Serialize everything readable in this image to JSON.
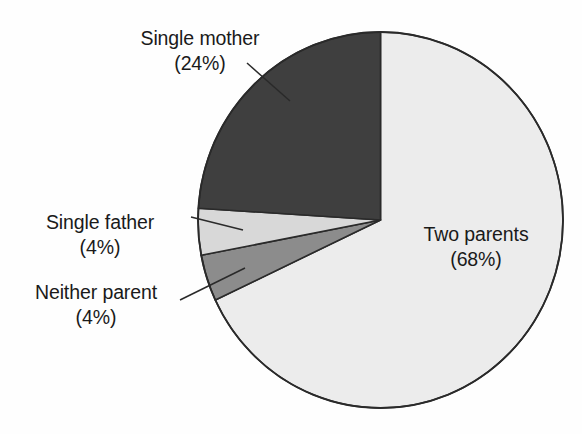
{
  "figure": {
    "background_color": "#fefefe",
    "width": 582,
    "height": 434
  },
  "chart_data": {
    "type": "pie",
    "title": "",
    "subtitle": "",
    "xlabel": "",
    "ylabel": "",
    "legend_position": "none",
    "grid": false,
    "units": "percent",
    "total": 100,
    "start_angle_deg": 0,
    "direction": "clockwise",
    "categories": [
      "Two parents",
      "Single mother",
      "Single father",
      "Neither parent"
    ],
    "values": [
      68,
      24,
      4,
      4
    ],
    "labels": [
      "Two parents (68%)",
      "Single mother (24%)",
      "Single father (4%)",
      "Neither parent (4%)"
    ],
    "colors": [
      "#ececec",
      "#3f3f3f",
      "#d8d8d8",
      "#8c8c8c"
    ],
    "slices": [
      {
        "name": "Two parents",
        "value": 68,
        "value_text": "(68%)",
        "color": "#ececec",
        "start_angle_deg": 0,
        "end_angle_deg": 244.8,
        "label_placement": "inside-right",
        "has_leader_line": false
      },
      {
        "name": "Single mother",
        "value": 24,
        "value_text": "(24%)",
        "color": "#3f3f3f",
        "start_angle_deg": 273.6,
        "end_angle_deg": 360,
        "label_placement": "outside-top-left",
        "has_leader_line": true
      },
      {
        "name": "Single father",
        "value": 4,
        "value_text": "(4%)",
        "color": "#d8d8d8",
        "start_angle_deg": 259.2,
        "end_angle_deg": 273.6,
        "label_placement": "outside-left",
        "has_leader_line": true
      },
      {
        "name": "Neither parent",
        "value": 4,
        "value_text": "(4%)",
        "color": "#8c8c8c",
        "start_angle_deg": 244.8,
        "end_angle_deg": 259.2,
        "label_placement": "outside-bottom-left",
        "has_leader_line": true
      }
    ]
  },
  "labels": {
    "single_mother": {
      "name": "Single mother",
      "percent": "(24%)"
    },
    "single_father": {
      "name": "Single father",
      "percent": "(4%)"
    },
    "neither_parent": {
      "name": "Neither parent",
      "percent": "(4%)"
    },
    "two_parents": {
      "name": "Two parents",
      "percent": "(68%)"
    }
  },
  "style": {
    "outline_color": "#2a2a2a",
    "leader_line_color": "#2a2a2a",
    "text_color": "#1a1a1a"
  }
}
